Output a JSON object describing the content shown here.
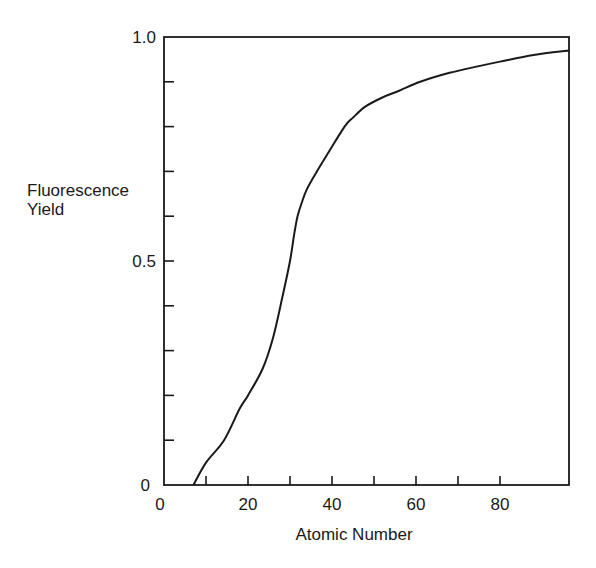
{
  "chart_data": {
    "type": "line",
    "title": "",
    "xlabel": "Atomic Number",
    "ylabel_lines": [
      "Fluorescence",
      "Yield"
    ],
    "ylabel": "Fluorescence Yield",
    "xlim": [
      0,
      96.5
    ],
    "ylim": [
      0,
      1.0
    ],
    "x_ticks": [
      0,
      10,
      20,
      30,
      40,
      50,
      60,
      70,
      80
    ],
    "x_tick_labels": [
      {
        "value": 0,
        "label": "0"
      },
      {
        "value": 20,
        "label": "20"
      },
      {
        "value": 40,
        "label": "40"
      },
      {
        "value": 60,
        "label": "60"
      },
      {
        "value": 80,
        "label": "80"
      }
    ],
    "y_ticks": [
      0,
      0.1,
      0.2,
      0.3,
      0.4,
      0.5,
      0.6,
      0.7,
      0.8,
      0.9,
      1.0
    ],
    "y_tick_labels": [
      {
        "value": 0,
        "label": "0"
      },
      {
        "value": 0.5,
        "label": "0.5"
      },
      {
        "value": 1.0,
        "label": "1.0"
      }
    ],
    "grid": false,
    "legend": null,
    "series": [
      {
        "name": "Fluorescence Yield",
        "x": [
          7,
          10,
          14.3,
          18,
          20,
          23.5,
          26,
          28.2,
          30,
          31,
          31.8,
          32.8,
          34,
          36.4,
          39,
          43,
          45,
          48,
          52,
          56,
          61,
          68,
          75,
          80,
          88,
          96.5
        ],
        "y": [
          0,
          0.05,
          0.1,
          0.17,
          0.2,
          0.26,
          0.33,
          0.42,
          0.5,
          0.56,
          0.6,
          0.63,
          0.66,
          0.7,
          0.74,
          0.8,
          0.82,
          0.845,
          0.865,
          0.88,
          0.9,
          0.92,
          0.935,
          0.945,
          0.96,
          0.97
        ]
      }
    ]
  },
  "plot": {
    "x0_px": 164,
    "px_per_x": 4.2,
    "y0_px": 485,
    "y1_px": 37,
    "right_px": 569
  }
}
